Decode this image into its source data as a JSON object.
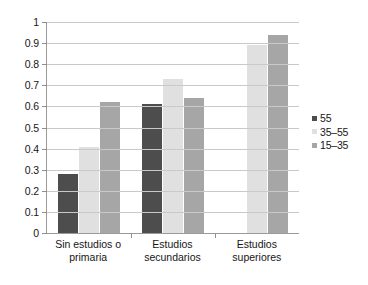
{
  "chart_data": {
    "type": "bar",
    "title": "",
    "subtitle": "",
    "xlabel": "",
    "ylabel": "",
    "ylim": [
      0,
      1
    ],
    "ytick_labels": [
      "1",
      "0.9",
      "0.8",
      "0.7",
      "0.6",
      "0.5",
      "0.4",
      "0.3",
      "0.2",
      "0.1",
      "0"
    ],
    "ytick_values": [
      1,
      0.9,
      0.8,
      0.7,
      0.6,
      0.5,
      0.4,
      0.3,
      0.2,
      0.1,
      0
    ],
    "grid": true,
    "legend_position": "right",
    "categories": [
      "Sin estudios o primaria",
      "Estudios secundarios",
      "Estudios superiores"
    ],
    "category_lines": [
      [
        "Sin estudios o",
        "primaria"
      ],
      [
        "Estudios",
        "secundarios"
      ],
      [
        "Estudios",
        "superiores"
      ]
    ],
    "series": [
      {
        "name": "55",
        "color": "#4d4d4d",
        "values": [
          0.28,
          0.61,
          null
        ]
      },
      {
        "name": "35–55",
        "color": "#e0e0e0",
        "values": [
          0.41,
          0.73,
          0.89
        ]
      },
      {
        "name": "15–35",
        "color": "#a6a6a6",
        "values": [
          0.62,
          0.64,
          0.94
        ]
      }
    ]
  },
  "legend": {
    "items": [
      {
        "label": "55",
        "color": "#4d4d4d"
      },
      {
        "label": "35–55",
        "color": "#e0e0e0"
      },
      {
        "label": "15–35",
        "color": "#a6a6a6"
      }
    ]
  },
  "artifacts": {
    "bleed_text": ""
  }
}
